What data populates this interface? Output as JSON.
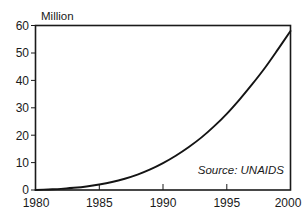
{
  "chart_data": {
    "type": "line",
    "title": "",
    "subtitle": "",
    "xlabel": "",
    "ylabel": "Million",
    "ylabel_position": "above-axis-top-left",
    "xlim": [
      1980,
      2000
    ],
    "ylim": [
      0,
      60
    ],
    "grid": false,
    "legend": false,
    "legend_position": "none",
    "annotations": [
      {
        "text": "Source: UNAIDS",
        "style": "italic",
        "position": "inside-bottom-right"
      }
    ],
    "x_ticks": [
      1980,
      1985,
      1990,
      1995,
      2000
    ],
    "x_tick_labels": [
      "1980",
      "1985",
      "1990",
      "1995",
      "2000"
    ],
    "y_ticks": [
      0,
      10,
      20,
      30,
      40,
      50,
      60
    ],
    "y_tick_labels": [
      "0",
      "10",
      "20",
      "30",
      "40",
      "50",
      "60"
    ],
    "series": [
      {
        "name": "People living with HIV/AIDS",
        "x": [
          1980,
          1981,
          1982,
          1983,
          1984,
          1985,
          1986,
          1987,
          1988,
          1989,
          1990,
          1991,
          1992,
          1993,
          1994,
          1995,
          1996,
          1997,
          1998,
          1999,
          2000
        ],
        "values": [
          0.0,
          0.2,
          0.4,
          0.8,
          1.3,
          2.0,
          2.9,
          4.1,
          5.6,
          7.5,
          9.8,
          12.5,
          15.6,
          19.1,
          23.2,
          27.8,
          33.0,
          38.6,
          44.6,
          51.2,
          58.0
        ]
      }
    ]
  },
  "axis": {
    "y_label": "Million",
    "source_note": "Source: UNAIDS"
  },
  "colors": {
    "background": "#ffffff",
    "axis": "#1a1a1a",
    "curve": "#141414",
    "text": "#1a1a1a"
  }
}
